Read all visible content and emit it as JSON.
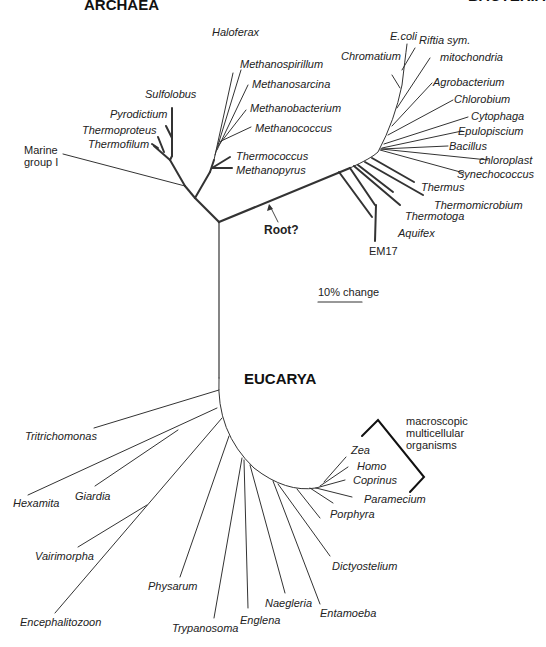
{
  "domains": {
    "archaea": "ARCHAEA",
    "bacteria": "BACTERIA",
    "eucarya": "EUCARYA"
  },
  "archaea": {
    "taxa": [
      "Haloferax",
      "Methanospirillum",
      "Methanosarcina",
      "Methanobacterium",
      "Methanococcus",
      "Thermococcus",
      "Methanopyrus",
      "Sulfolobus",
      "Pyrodictium",
      "Thermoproteus",
      "Thermofilum"
    ],
    "marine_group": [
      "Marine",
      "group I"
    ]
  },
  "bacteria": {
    "taxa": [
      "E.coli",
      "Riftia sym.",
      "Chromatium",
      "mitochondria",
      "Agrobacterium",
      "Chlorobium",
      "Cytophaga",
      "Epulopiscium",
      "Bacillus",
      "chloroplast",
      "Synechococcus",
      "Thermus",
      "Thermomicrobium",
      "Thermotoga",
      "Aquifex"
    ],
    "em17": "EM17"
  },
  "eucarya": {
    "taxa": [
      "Zea",
      "Homo",
      "Coprinus",
      "Paramecium",
      "Porphyra",
      "Dictyostelium",
      "Entamoeba",
      "Naegleria",
      "Englena",
      "Trypanosoma",
      "Physarum",
      "Encephalitozoon",
      "Vairimorpha",
      "Giardia",
      "Hexamita",
      "Tritrichomonas"
    ],
    "bracket_label": [
      "macroscopic",
      "multicellular",
      "organisms"
    ]
  },
  "root_label": "Root?",
  "scale_bar": {
    "label": "10% change"
  },
  "colors": {
    "line": "#333333",
    "text": "#222222"
  }
}
